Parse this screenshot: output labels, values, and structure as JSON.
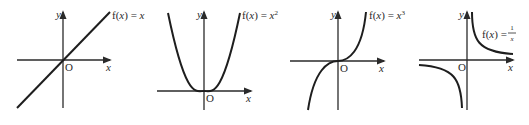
{
  "figure": {
    "graphs": [
      {
        "id": "linear",
        "label_prefix": "f(",
        "label_var": "x",
        "label_mid": ") = ",
        "label_rhs": "x",
        "label_sup": "",
        "y_axis_label": "y",
        "x_axis_label": "x",
        "origin_label": "O"
      },
      {
        "id": "quadratic",
        "label_prefix": "f(",
        "label_var": "x",
        "label_mid": ") = ",
        "label_rhs": "x",
        "label_sup": "2",
        "y_axis_label": "y",
        "x_axis_label": "x",
        "origin_label": "O"
      },
      {
        "id": "cubic",
        "label_prefix": "f(",
        "label_var": "x",
        "label_mid": ") = ",
        "label_rhs": "x",
        "label_sup": "3",
        "y_axis_label": "y",
        "x_axis_label": "x",
        "origin_label": "O"
      },
      {
        "id": "reciprocal",
        "label_prefix": "f(",
        "label_var": "x",
        "label_mid": ") = ",
        "label_num": "1",
        "label_den": "x",
        "y_axis_label": "y",
        "x_axis_label": "x",
        "origin_label": "O"
      }
    ]
  }
}
